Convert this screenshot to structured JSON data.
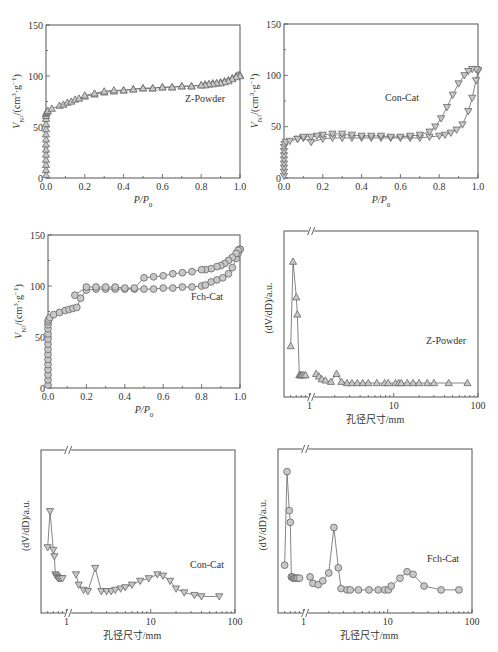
{
  "chart_data": [
    {
      "id": "iso-zpowder",
      "type": "scatter",
      "title": "",
      "legend": "Z-Powder",
      "xlabel": "P/P0",
      "ylabel": "V_N2/(cm3·g-1)",
      "xlim": [
        0,
        1.0
      ],
      "ylim": [
        0,
        150
      ],
      "xticks": [
        "0.0",
        "0.2",
        "0.4",
        "0.6",
        "0.8",
        "1.0"
      ],
      "yticks": [
        "0",
        "50",
        "100",
        "150"
      ],
      "marker": "triangle-up",
      "series": [
        {
          "name": "adsorption",
          "x": [
            0,
            0,
            0,
            0,
            0,
            0,
            0,
            0,
            0,
            0,
            0,
            0,
            0,
            0,
            0.002,
            0.005,
            0.01,
            0.03,
            0.07,
            0.09,
            0.11,
            0.13,
            0.15,
            0.17,
            0.2,
            0.25,
            0.3,
            0.35,
            0.4,
            0.45,
            0.5,
            0.55,
            0.6,
            0.65,
            0.7,
            0.75,
            0.8,
            0.82,
            0.84,
            0.86,
            0.88,
            0.9,
            0.92,
            0.94,
            0.96,
            0.98,
            0.99,
            1.0
          ],
          "y": [
            3,
            8,
            13,
            18,
            23,
            28,
            33,
            38,
            43,
            48,
            53,
            58,
            61,
            63,
            64,
            65,
            66,
            68,
            71,
            72,
            74,
            75,
            77,
            78,
            80,
            82,
            84,
            85,
            86,
            87,
            88,
            88,
            89,
            89,
            90,
            90,
            91,
            92,
            92,
            93,
            93,
            94,
            95,
            96,
            98,
            100,
            101,
            101
          ]
        },
        {
          "name": "desorption",
          "x": [
            1.0,
            0.98,
            0.96,
            0.94,
            0.92,
            0.9,
            0.88,
            0.86,
            0.84,
            0.82,
            0.8,
            0.75,
            0.7,
            0.65,
            0.6,
            0.55,
            0.5,
            0.45,
            0.4,
            0.35,
            0.3,
            0.25,
            0.2
          ],
          "y": [
            100,
            99,
            97,
            95,
            94,
            93,
            93,
            92,
            92,
            91,
            91,
            90,
            90,
            89,
            89,
            88,
            88,
            87,
            86,
            86,
            85,
            83,
            81
          ]
        }
      ]
    },
    {
      "id": "iso-concat",
      "type": "scatter",
      "legend": "Con-Cat",
      "xlabel": "P/P0",
      "ylabel": "V_N2/(cm3·g-1)",
      "xlim": [
        0,
        1.0
      ],
      "ylim": [
        0,
        150
      ],
      "xticks": [
        "0.0",
        "0.2",
        "0.4",
        "0.6",
        "0.8",
        "1.0"
      ],
      "yticks": [
        "0",
        "50",
        "100",
        "150"
      ],
      "marker": "triangle-down",
      "series": [
        {
          "name": "adsorption",
          "x": [
            0,
            0,
            0,
            0,
            0,
            0,
            0,
            0,
            0.003,
            0.01,
            0.03,
            0.07,
            0.1,
            0.14,
            0.2,
            0.25,
            0.3,
            0.35,
            0.4,
            0.45,
            0.5,
            0.55,
            0.6,
            0.65,
            0.7,
            0.75,
            0.8,
            0.83,
            0.86,
            0.89,
            0.92,
            0.95,
            0.97,
            0.99,
            1.0
          ],
          "y": [
            2,
            6,
            10,
            14,
            18,
            22,
            26,
            30,
            33,
            35,
            36,
            38,
            39,
            35,
            38,
            39,
            39,
            39,
            39,
            39,
            39,
            39,
            39,
            39,
            39,
            40,
            41,
            42,
            44,
            47,
            52,
            65,
            78,
            95,
            104
          ]
        },
        {
          "name": "desorption",
          "x": [
            1.0,
            0.99,
            0.97,
            0.95,
            0.93,
            0.9,
            0.87,
            0.84,
            0.81,
            0.78,
            0.75,
            0.7,
            0.65,
            0.6,
            0.55,
            0.5,
            0.45,
            0.4,
            0.35,
            0.3,
            0.25,
            0.2,
            0.17,
            0.14,
            0.1,
            0.07
          ],
          "y": [
            105,
            106,
            106,
            104,
            100,
            92,
            81,
            69,
            58,
            50,
            45,
            42,
            41,
            40,
            40,
            41,
            41,
            41,
            42,
            43,
            43,
            42,
            41,
            40,
            40,
            38
          ]
        }
      ]
    },
    {
      "id": "iso-fchcat",
      "type": "scatter",
      "legend": "Fch-Cat",
      "xlabel": "P/P0",
      "ylabel": "V_N2/(cm3·g-1)",
      "xlim": [
        0,
        1.0
      ],
      "ylim": [
        0,
        150
      ],
      "xticks": [
        "0.0",
        "0.2",
        "0.4",
        "0.6",
        "0.8",
        "1.0"
      ],
      "yticks": [
        "0",
        "50",
        "100",
        "150"
      ],
      "marker": "circle",
      "series": [
        {
          "name": "adsorption",
          "x": [
            0,
            0,
            0,
            0,
            0,
            0,
            0,
            0,
            0,
            0,
            0,
            0,
            0,
            0,
            0.003,
            0.01,
            0.03,
            0.06,
            0.09,
            0.11,
            0.13,
            0.15,
            0.17,
            0.2,
            0.25,
            0.3,
            0.35,
            0.4,
            0.45,
            0.5,
            0.55,
            0.6,
            0.65,
            0.7,
            0.75,
            0.8,
            0.82,
            0.85,
            0.88,
            0.91,
            0.94,
            0.96,
            0.98,
            0.99,
            1.0
          ],
          "y": [
            3,
            8,
            13,
            18,
            23,
            28,
            33,
            38,
            43,
            48,
            53,
            58,
            62,
            65,
            67,
            69,
            72,
            74,
            76,
            77,
            78,
            79,
            88,
            96,
            97,
            97,
            97,
            97,
            97,
            97,
            97,
            98,
            98,
            99,
            99,
            100,
            101,
            104,
            106,
            108,
            112,
            118,
            127,
            132,
            136
          ]
        },
        {
          "name": "desorption",
          "x": [
            1.0,
            0.99,
            0.98,
            0.96,
            0.94,
            0.92,
            0.9,
            0.88,
            0.85,
            0.82,
            0.8,
            0.75,
            0.7,
            0.65,
            0.6,
            0.55,
            0.5,
            0.45,
            0.4,
            0.35,
            0.3,
            0.25,
            0.2,
            0.14
          ],
          "y": [
            136,
            135,
            132,
            128,
            125,
            122,
            120,
            119,
            117,
            116,
            116,
            114,
            113,
            112,
            110,
            109,
            108,
            98,
            98,
            99,
            99,
            99,
            99,
            91
          ]
        }
      ]
    },
    {
      "id": "psd-zpowder",
      "type": "line",
      "legend": "Z-Powder",
      "xlabel": "孔径尺寸/mm",
      "ylabel": "(dV/dD)/a.u.",
      "xscale": "log",
      "xlim": [
        0.5,
        100
      ],
      "ylim": [
        0,
        1
      ],
      "xticks": [
        "1",
        "10",
        "100"
      ],
      "axis_break": true,
      "marker": "triangle-up",
      "series": [
        {
          "name": "segment-1",
          "x": [
            0.6,
            0.64,
            0.7,
            0.72,
            0.76,
            0.78,
            0.8,
            0.82,
            0.86,
            0.9
          ],
          "y": [
            0.28,
            0.92,
            0.65,
            0.52,
            0.06,
            0.06,
            0.06,
            0.06,
            0.06,
            0.06
          ]
        },
        {
          "name": "segment-2",
          "x": [
            1.2,
            1.3,
            1.4,
            1.55,
            1.8,
            2.1,
            2.4,
            2.8,
            3.2,
            3.7,
            4.3,
            5.0,
            6.3,
            7.8,
            8.6,
            10.5,
            11.5,
            12.3,
            14.5,
            17,
            20,
            25,
            30,
            45,
            75
          ],
          "y": [
            0.07,
            0.05,
            0.03,
            0.02,
            0.01,
            0.07,
            0.01,
            0.0,
            0.0,
            0.0,
            0.0,
            0.0,
            0.0,
            0.0,
            0.0,
            0.0,
            0.0,
            0.0,
            0.0,
            0.0,
            0.0,
            0.0,
            0.0,
            0.0,
            0.0
          ]
        }
      ]
    },
    {
      "id": "psd-concat",
      "type": "line",
      "legend": "Con-Cat",
      "xlabel": "孔径尺寸/mm",
      "ylabel": "(dV/dD)/a.u.",
      "xscale": "log",
      "xlim": [
        0.5,
        100
      ],
      "ylim": [
        0,
        1
      ],
      "xticks": [
        "1",
        "10",
        "100"
      ],
      "axis_break": true,
      "marker": "triangle-down",
      "series": [
        {
          "name": "segment-1",
          "x": [
            0.6,
            0.64,
            0.7,
            0.72,
            0.74,
            0.76,
            0.78,
            0.8,
            0.83,
            0.86,
            0.9
          ],
          "y": [
            0.4,
            0.68,
            0.38,
            0.33,
            0.19,
            0.18,
            0.17,
            0.16,
            0.16,
            0.16,
            0.16
          ]
        },
        {
          "name": "segment-2",
          "x": [
            1.3,
            1.4,
            1.6,
            1.8,
            2.2,
            2.6,
            3.0,
            3.4,
            3.8,
            4.4,
            5.0,
            6.0,
            7.5,
            9.5,
            12,
            14,
            17,
            20,
            25,
            33,
            40,
            65
          ],
          "y": [
            0.19,
            0.11,
            0.07,
            0.06,
            0.24,
            0.06,
            0.06,
            0.06,
            0.07,
            0.08,
            0.09,
            0.11,
            0.14,
            0.16,
            0.19,
            0.18,
            0.14,
            0.08,
            0.05,
            0.03,
            0.02,
            0.02
          ]
        }
      ]
    },
    {
      "id": "psd-fchcat",
      "type": "line",
      "legend": "Fch-Cat",
      "xlabel": "孔径尺寸/mm",
      "ylabel": "(dV/dD)/a.u.",
      "xscale": "log",
      "xlim": [
        0.5,
        100
      ],
      "ylim": [
        0,
        1
      ],
      "xticks": [
        "1",
        "10",
        "100"
      ],
      "axis_break": true,
      "marker": "circle",
      "series": [
        {
          "name": "segment-1",
          "x": [
            0.6,
            0.64,
            0.68,
            0.7,
            0.72,
            0.74,
            0.76,
            0.78,
            0.8,
            0.83,
            0.86,
            0.9
          ],
          "y": [
            0.26,
            0.98,
            0.68,
            0.59,
            0.17,
            0.17,
            0.16,
            0.16,
            0.16,
            0.16,
            0.16,
            0.16
          ]
        },
        {
          "name": "segment-2",
          "x": [
            1.2,
            1.3,
            1.5,
            1.7,
            2.0,
            2.3,
            2.6,
            2.8,
            3.3,
            3.6,
            4.5,
            6.0,
            7.7,
            9.2,
            10.2,
            11,
            14,
            17,
            20,
            27,
            43,
            70
          ],
          "y": [
            0.17,
            0.12,
            0.11,
            0.14,
            0.2,
            0.55,
            0.24,
            0.08,
            0.07,
            0.07,
            0.07,
            0.07,
            0.07,
            0.07,
            0.07,
            0.1,
            0.16,
            0.21,
            0.19,
            0.1,
            0.07,
            0.07
          ]
        }
      ]
    }
  ],
  "labels": {
    "iso_xlabel": "P/P",
    "iso_xlabel_sub": "0",
    "iso_ylabel_v": "V",
    "iso_ylabel_sub": "N",
    "iso_ylabel_sub2": "2",
    "iso_ylabel_rest": "/(cm",
    "iso_ylabel_sup": "3",
    "iso_ylabel_rest2": "·g",
    "iso_ylabel_sup2": "−1",
    "iso_ylabel_close": ")",
    "psd_xlabel": "孔径尺寸/mm",
    "psd_ylabel": "(dV/dD)/a.u.",
    "legend_zpowder": "Z-Powder",
    "legend_concat": "Con-Cat",
    "legend_fchcat": "Fch-Cat"
  }
}
